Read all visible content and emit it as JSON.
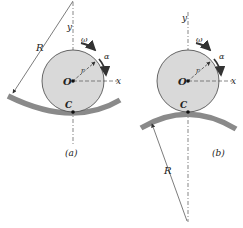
{
  "figure": {
    "panels": [
      {
        "id": "a",
        "caption": "(a)",
        "center_label": "O",
        "contact_label": "C",
        "radius_label": "r",
        "curvature_label": "R",
        "x_axis_label": "x",
        "y_axis_label": "y",
        "angular_velocity_label": "ω",
        "angular_acceleration_label": "α",
        "surface_type": "concave"
      },
      {
        "id": "b",
        "caption": "(b)",
        "center_label": "O",
        "contact_label": "C",
        "radius_label": "r",
        "curvature_label": "R",
        "x_axis_label": "x",
        "y_axis_label": "y",
        "angular_velocity_label": "ω",
        "angular_acceleration_label": "α",
        "surface_type": "convex"
      }
    ],
    "colors": {
      "disk_fill": "#d9d9d9",
      "disk_stroke": "#333333",
      "surface": "#8a8a8a",
      "line": "#444444"
    }
  }
}
